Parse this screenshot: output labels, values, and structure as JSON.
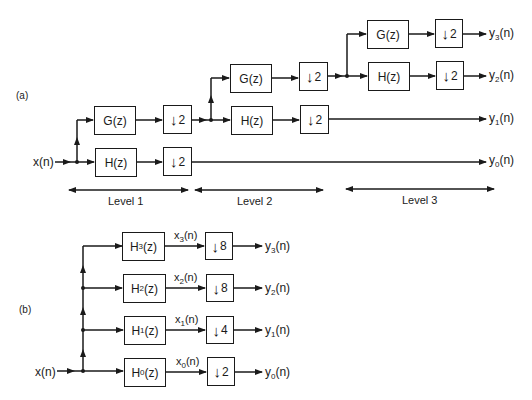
{
  "part_a": {
    "label": "(a)",
    "input": "x(n)",
    "levels": [
      {
        "label": "Level 1",
        "highpass": "G(z)",
        "lowpass": "H(z)",
        "downsample": "2"
      },
      {
        "label": "Level 2",
        "highpass": "G(z)",
        "lowpass": "H(z)",
        "downsample": "2"
      },
      {
        "label": "Level 3",
        "highpass": "G(z)",
        "lowpass": "H(z)",
        "downsample": "2"
      }
    ],
    "outputs": [
      {
        "base": "y",
        "sub": "3",
        "arg": "(n)"
      },
      {
        "base": "y",
        "sub": "2",
        "arg": "(n)"
      },
      {
        "base": "y",
        "sub": "1",
        "arg": "(n)"
      },
      {
        "base": "y",
        "sub": "0",
        "arg": "(n)"
      }
    ]
  },
  "part_b": {
    "label": "(b)",
    "input": "x(n)",
    "branches": [
      {
        "filter_base": "H",
        "filter_sub": "3",
        "filter_arg": "(z)",
        "signal_base": "x",
        "signal_sub": "3",
        "signal_arg": "(n)",
        "factor": "8",
        "out_base": "y",
        "out_sub": "3",
        "out_arg": "(n)"
      },
      {
        "filter_base": "H",
        "filter_sub": "2",
        "filter_arg": "(z)",
        "signal_base": "x",
        "signal_sub": "2",
        "signal_arg": "(n)",
        "factor": "8",
        "out_base": "y",
        "out_sub": "2",
        "out_arg": "(n)"
      },
      {
        "filter_base": "H",
        "filter_sub": "1",
        "filter_arg": "(z)",
        "signal_base": "x",
        "signal_sub": "1",
        "signal_arg": "(n)",
        "factor": "4",
        "out_base": "y",
        "out_sub": "1",
        "out_arg": "(n)"
      },
      {
        "filter_base": "H",
        "filter_sub": "0",
        "filter_arg": "(z)",
        "signal_base": "x",
        "signal_sub": "0",
        "signal_arg": "(n)",
        "factor": "2",
        "out_base": "y",
        "out_sub": "0",
        "out_arg": "(n)"
      }
    ]
  },
  "icons": {
    "downsample": "↓"
  }
}
